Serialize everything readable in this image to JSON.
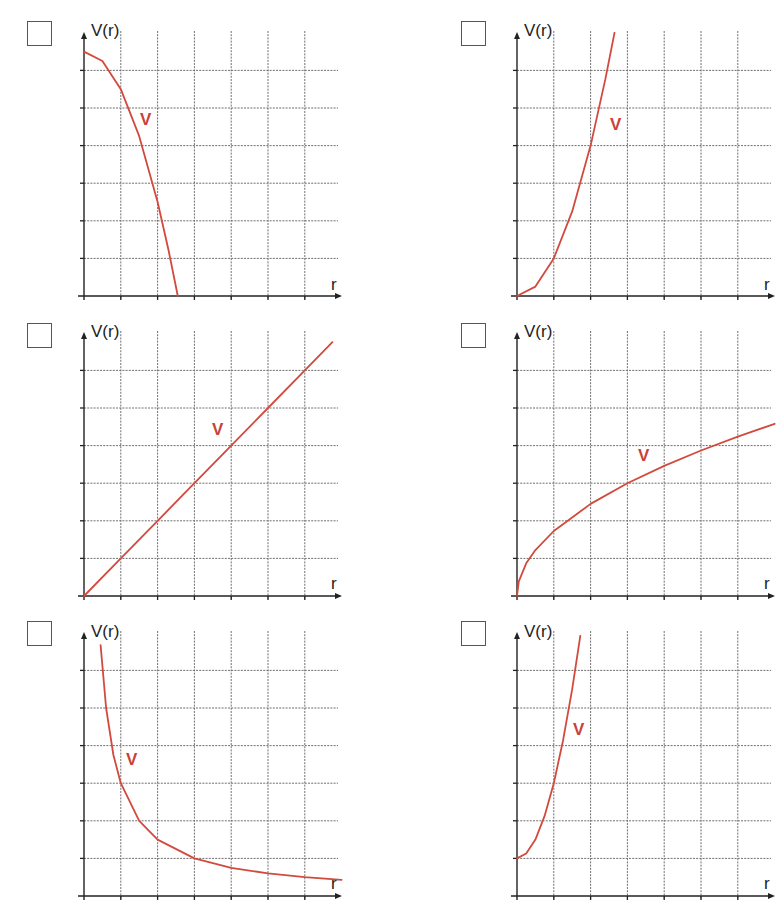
{
  "page": {
    "background": "#ffffff",
    "curve_color": "#d24a3e",
    "axis_color": "#222222",
    "grid_color": "#6f6f6f"
  },
  "chart_data": [
    {
      "type": "line",
      "id": "top-left",
      "title": "",
      "ylabel": "V(r)",
      "xlabel": "r",
      "series": [
        {
          "name": "V",
          "label": "V",
          "formula": "V = 6.5 - r^2",
          "x": [
            0,
            0.5,
            1,
            1.5,
            2,
            2.3,
            2.55
          ],
          "values": [
            6.5,
            6.25,
            5.5,
            4.25,
            2.5,
            1.21,
            0
          ]
        }
      ],
      "grid": true,
      "xlim": [
        0,
        7
      ],
      "ylim": [
        0,
        7
      ],
      "x_gridlines": 6,
      "y_gridlines": 6,
      "checkbox_checked": false
    },
    {
      "type": "line",
      "id": "top-right",
      "title": "",
      "ylabel": "V(r)",
      "xlabel": "r",
      "series": [
        {
          "name": "V",
          "label": "V",
          "formula": "V = r^2",
          "x": [
            0,
            0.5,
            1,
            1.5,
            2,
            2.4,
            2.65
          ],
          "values": [
            0,
            0.25,
            1,
            2.25,
            4,
            5.76,
            7.0
          ]
        }
      ],
      "grid": true,
      "xlim": [
        0,
        7
      ],
      "ylim": [
        0,
        7
      ],
      "x_gridlines": 6,
      "y_gridlines": 6,
      "checkbox_checked": false
    },
    {
      "type": "line",
      "id": "middle-left",
      "title": "",
      "ylabel": "V(r)",
      "xlabel": "r",
      "series": [
        {
          "name": "V",
          "label": "V",
          "formula": "V = r",
          "x": [
            0,
            1,
            2,
            3,
            4,
            5,
            6,
            6.75
          ],
          "values": [
            0,
            1,
            2,
            3,
            4,
            5,
            6,
            6.75
          ]
        }
      ],
      "grid": true,
      "xlim": [
        0,
        7
      ],
      "ylim": [
        0,
        7
      ],
      "x_gridlines": 6,
      "y_gridlines": 6,
      "checkbox_checked": false
    },
    {
      "type": "line",
      "id": "middle-right",
      "title": "",
      "ylabel": "V(r)",
      "xlabel": "r",
      "series": [
        {
          "name": "V",
          "label": "V",
          "formula": "V = sqrt(3r)",
          "x": [
            0,
            0.05,
            0.25,
            0.5,
            1,
            2,
            3,
            4,
            5,
            6,
            7
          ],
          "values": [
            0,
            0.39,
            0.87,
            1.22,
            1.73,
            2.45,
            3.0,
            3.46,
            3.87,
            4.24,
            4.58
          ]
        }
      ],
      "grid": true,
      "xlim": [
        0,
        7
      ],
      "ylim": [
        0,
        7
      ],
      "x_gridlines": 6,
      "y_gridlines": 6,
      "checkbox_checked": false
    },
    {
      "type": "line",
      "id": "bottom-left",
      "title": "",
      "ylabel": "V(r)",
      "xlabel": "r",
      "series": [
        {
          "name": "V",
          "label": "V",
          "formula": "V = 3/r",
          "x": [
            0.45,
            0.6,
            0.8,
            1,
            1.5,
            2,
            3,
            4,
            5,
            6,
            7
          ],
          "values": [
            6.67,
            5.0,
            3.75,
            3.0,
            2.0,
            1.5,
            1.0,
            0.75,
            0.6,
            0.5,
            0.43
          ]
        }
      ],
      "grid": true,
      "xlim": [
        0,
        7
      ],
      "ylim": [
        0,
        7
      ],
      "x_gridlines": 6,
      "y_gridlines": 6,
      "checkbox_checked": false
    },
    {
      "type": "line",
      "id": "bottom-right",
      "title": "",
      "ylabel": "V(r)",
      "xlabel": "r",
      "series": [
        {
          "name": "V",
          "label": "V",
          "formula": "V = 1 + 2r^2",
          "x": [
            0,
            0.25,
            0.5,
            0.75,
            1,
            1.25,
            1.5,
            1.72
          ],
          "values": [
            1,
            1.13,
            1.5,
            2.13,
            3,
            4.13,
            5.5,
            6.92
          ]
        }
      ],
      "grid": true,
      "xlim": [
        0,
        7
      ],
      "ylim": [
        0,
        7
      ],
      "x_gridlines": 6,
      "y_gridlines": 6,
      "checkbox_checked": false
    }
  ],
  "labels": {
    "y_axis": "V(r)",
    "x_axis": "r",
    "curve": "V"
  }
}
